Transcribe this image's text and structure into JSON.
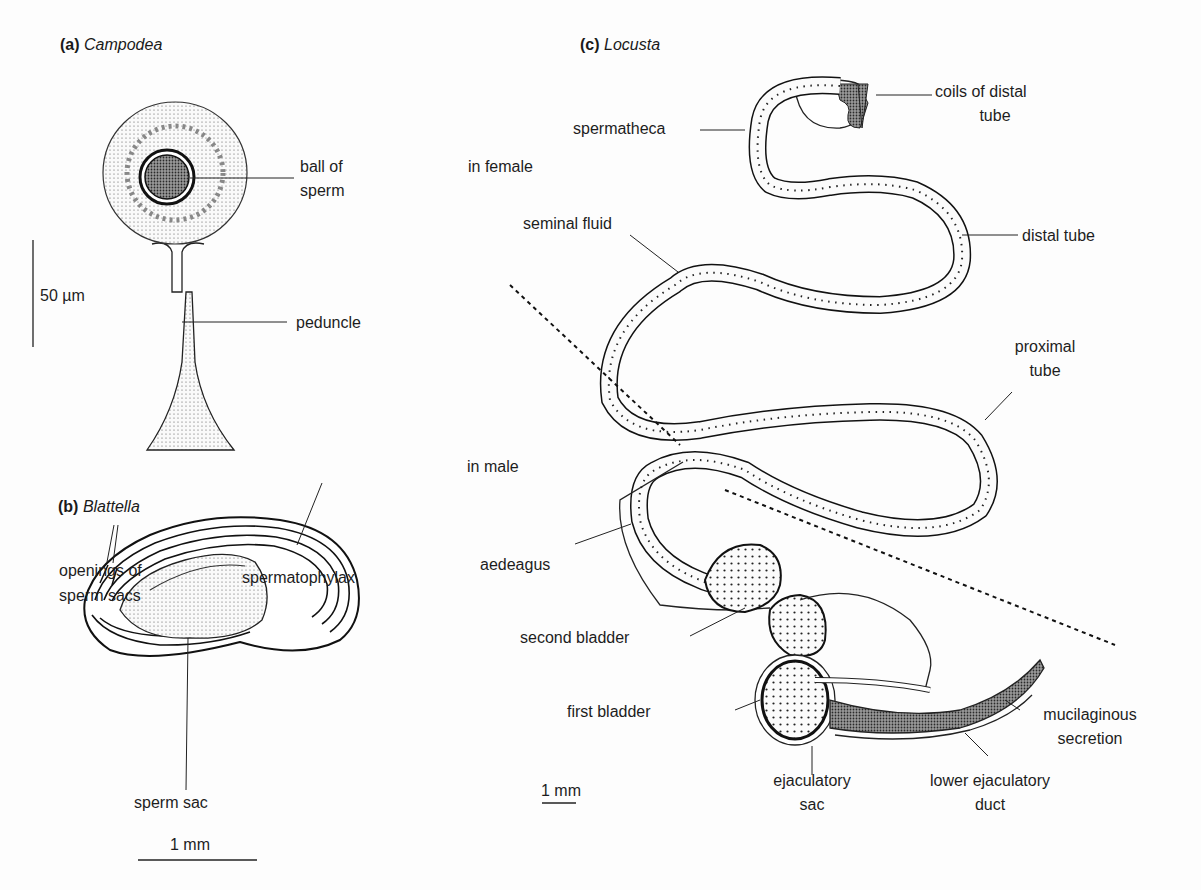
{
  "figure": {
    "panels": [
      {
        "id": "a",
        "letter": "(a)",
        "genus": "Campodea",
        "labels": {
          "ball_of_sperm_1": "ball of",
          "ball_of_sperm_2": "sperm",
          "peduncle": "peduncle"
        },
        "scale_bar": "50 µm"
      },
      {
        "id": "b",
        "letter": "(b)",
        "genus": "Blattella",
        "labels": {
          "openings_1": "openings of",
          "openings_2": "sperm sacs",
          "spermatophylax": "spermatophylax",
          "sperm_sac": "sperm sac"
        },
        "scale_bar": "1 mm"
      },
      {
        "id": "c",
        "letter": "(c)",
        "genus": "Locusta",
        "regions": {
          "female": "in female",
          "male": "in male"
        },
        "labels": {
          "coils_1": "coils of distal",
          "coils_2": "tube",
          "spermatheca": "spermatheca",
          "seminal_fluid": "seminal fluid",
          "distal_tube": "distal tube",
          "proximal_1": "proximal",
          "proximal_2": "tube",
          "aedeagus": "aedeagus",
          "second_bladder": "second bladder",
          "first_bladder": "first bladder",
          "ejaculatory_sac_1": "ejaculatory",
          "ejaculatory_sac_2": "sac",
          "lower_duct_1": "lower ejaculatory",
          "lower_duct_2": "duct",
          "mucilaginous_1": "mucilaginous",
          "mucilaginous_2": "secretion"
        },
        "scale_bar": "1 mm"
      }
    ]
  }
}
